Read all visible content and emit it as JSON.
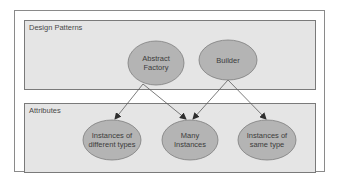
{
  "colors": {
    "frame_border": "#8a8a8a",
    "group_fill": "#e5e5e5",
    "group_border": "#7a7a7a",
    "node_fill": "#b4b4b4",
    "node_border": "#7e7e7e",
    "arrow": "#5a5a5a",
    "text": "#3c3c3c"
  },
  "groups": [
    {
      "id": "design-patterns",
      "label": "Design Patterns"
    },
    {
      "id": "attributes",
      "label": "Attributes"
    }
  ],
  "nodes": [
    {
      "id": "abstract-factory",
      "group": "design-patterns",
      "label": "Abstract\nFactory"
    },
    {
      "id": "builder",
      "group": "design-patterns",
      "label": "Builder"
    },
    {
      "id": "instances-different-types",
      "group": "attributes",
      "label": "Instances of\ndifferent types"
    },
    {
      "id": "many-instances",
      "group": "attributes",
      "label": "Many\nInstances"
    },
    {
      "id": "instances-same-type",
      "group": "attributes",
      "label": "Instances of\nsame type"
    }
  ],
  "edges": [
    {
      "from": "abstract-factory",
      "to": "instances-different-types"
    },
    {
      "from": "abstract-factory",
      "to": "many-instances"
    },
    {
      "from": "builder",
      "to": "many-instances"
    },
    {
      "from": "builder",
      "to": "instances-same-type"
    }
  ]
}
